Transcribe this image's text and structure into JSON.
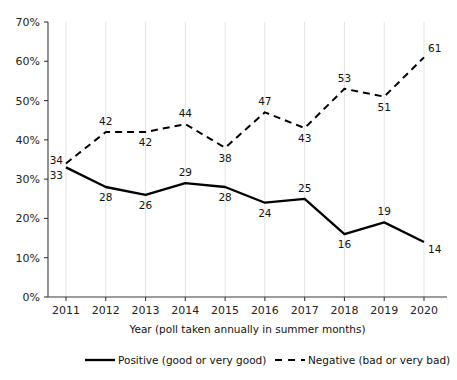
{
  "chart_data": {
    "type": "line",
    "title": "",
    "xlabel": "Year (poll taken annually in summer months)",
    "ylabel": "",
    "categories": [
      "2011",
      "2012",
      "2013",
      "2014",
      "2015",
      "2016",
      "2017",
      "2018",
      "2019",
      "2020"
    ],
    "ylim": [
      0,
      70
    ],
    "ytick_values": [
      0,
      10,
      20,
      30,
      40,
      50,
      60,
      70
    ],
    "ytick_labels": [
      "0%",
      "10%",
      "20%",
      "30%",
      "40%",
      "50%",
      "60%",
      "70%"
    ],
    "grid": "vertical-only",
    "legend_position": "bottom",
    "series": [
      {
        "name": "Positive (good or very good)",
        "style": "solid",
        "color": "#000000",
        "values": [
          33,
          28,
          26,
          29,
          28,
          24,
          25,
          16,
          19,
          14
        ],
        "label_positions": [
          "below",
          "below",
          "below",
          "above",
          "below",
          "below",
          "above",
          "below",
          "above",
          "below"
        ]
      },
      {
        "name": "Negative (bad or very bad)",
        "style": "dashed",
        "color": "#000000",
        "values": [
          34,
          42,
          42,
          44,
          38,
          47,
          43,
          53,
          51,
          61
        ],
        "label_positions": [
          "above",
          "above",
          "below",
          "above",
          "below",
          "above",
          "below",
          "above",
          "below",
          "above"
        ]
      }
    ]
  },
  "legend": {
    "items": [
      {
        "label": "Positive (good or very good)",
        "style": "solid"
      },
      {
        "label": "Negative (bad or very bad)",
        "style": "dashed"
      }
    ]
  }
}
